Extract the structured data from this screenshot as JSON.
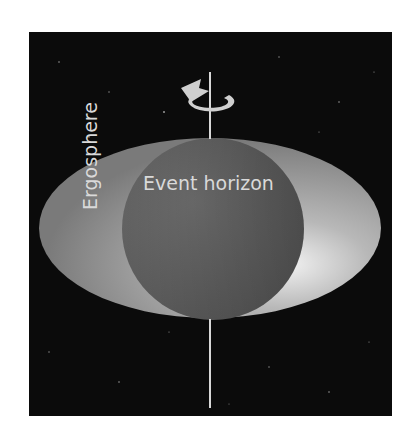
{
  "diagram": {
    "labels": {
      "event_horizon": "Event horizon",
      "ergosphere": "Ergosphere"
    },
    "icons": {
      "rotation": "rotation-arrow-icon",
      "axis": "rotation-axis"
    },
    "colors": {
      "background": "#ffffff",
      "space": "#0b0b0b",
      "ergosphere": "#8a8a8a",
      "event_horizon": "#6a6a6a",
      "highlight": "#e8e8e8",
      "axis": "#d8d8d8",
      "text": "#d9d9d9"
    }
  }
}
